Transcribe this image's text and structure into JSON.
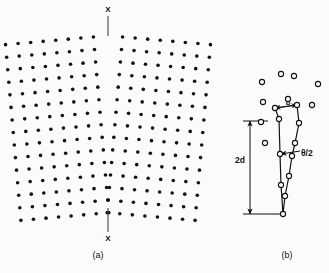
{
  "figure": {
    "type": "diagram",
    "background_color": "#fbfbfb",
    "ink_color": "#111111",
    "width": 329,
    "height": 273
  },
  "panel_a": {
    "caption": "(a)",
    "caption_x": 98,
    "caption_y": 258,
    "boundary_label_top": "X",
    "boundary_label_bottom": "X",
    "boundary_label_top_x": 108,
    "boundary_label_top_y": 12,
    "boundary_label_bottom_x": 108,
    "boundary_label_bottom_y": 241,
    "boundary_line_top": {
      "x1": 108,
      "y1": 16,
      "x2": 108,
      "y2": 36
    },
    "boundary_line_bottom": {
      "x1": 108,
      "y1": 208,
      "x2": 108,
      "y2": 232
    },
    "marker_style": "filled-dot",
    "dot_radius": 1.8,
    "dot_color": "#111111",
    "lattice": {
      "rows": 15,
      "cols_per_grain": 8,
      "row_spacing": 12.6,
      "col_spacing": 12.6,
      "boundary_x": 108,
      "top_y": 36,
      "tilt_half_angle_deg": 5.0,
      "description": "two grains meeting at a vertical symmetric tilt boundary at X-X; rows bend toward the boundary from each side"
    }
  },
  "panel_b": {
    "caption": "(b)",
    "caption_x": 287,
    "caption_y": 258,
    "marker_style": "open-circle",
    "circle_radius": 2.6,
    "circle_stroke": "#111111",
    "circle_fill": "#fbfbfb",
    "labels": {
      "spacing": "2d",
      "burgers": "b",
      "angle": "θ/2"
    },
    "spacing_label_pos": {
      "x": 240,
      "y": 163
    },
    "burgers_label_pos": {
      "x": 288,
      "y": 105
    },
    "angle_label_pos": {
      "x": 301,
      "y": 156
    },
    "dimension_line_2d": {
      "x": 250,
      "y1": 121,
      "y2": 214,
      "arrows": "both"
    },
    "tick_top_2d": {
      "x1": 243,
      "y1": 121,
      "x2": 268,
      "y2": 121
    },
    "tick_bottom_2d": {
      "x1": 243,
      "y1": 214,
      "x2": 281,
      "y2": 214
    },
    "burgers_line": {
      "x1": 275,
      "y1": 108,
      "x2": 297,
      "y2": 105,
      "arrows": "both"
    },
    "angle_line": {
      "x1": 281,
      "y1": 154,
      "x2": 300,
      "y2": 151,
      "arrows": "end"
    },
    "loose_atoms": [
      {
        "x": 262,
        "y": 82
      },
      {
        "x": 281,
        "y": 74
      },
      {
        "x": 294,
        "y": 76
      },
      {
        "x": 318,
        "y": 84
      },
      {
        "x": 263,
        "y": 102
      },
      {
        "x": 288,
        "y": 99
      },
      {
        "x": 312,
        "y": 105
      },
      {
        "x": 261,
        "y": 122
      },
      {
        "x": 265,
        "y": 143
      }
    ],
    "left_column_atoms": [
      {
        "x": 279,
        "y": 119
      },
      {
        "x": 280,
        "y": 154
      },
      {
        "x": 281,
        "y": 185
      },
      {
        "x": 283,
        "y": 214
      }
    ],
    "right_column_atoms": [
      {
        "x": 299,
        "y": 123
      },
      {
        "x": 295,
        "y": 143
      },
      {
        "x": 292,
        "y": 156
      },
      {
        "x": 289,
        "y": 176
      },
      {
        "x": 285,
        "y": 196
      }
    ],
    "top_connector_atoms": [
      {
        "x": 275,
        "y": 108
      },
      {
        "x": 297,
        "y": 105
      }
    ],
    "description": "magnified dislocation core: two atom rows converge downward, separated by spacing 2d, Burgers vector b across the top, misorientation half-angle theta/2"
  }
}
